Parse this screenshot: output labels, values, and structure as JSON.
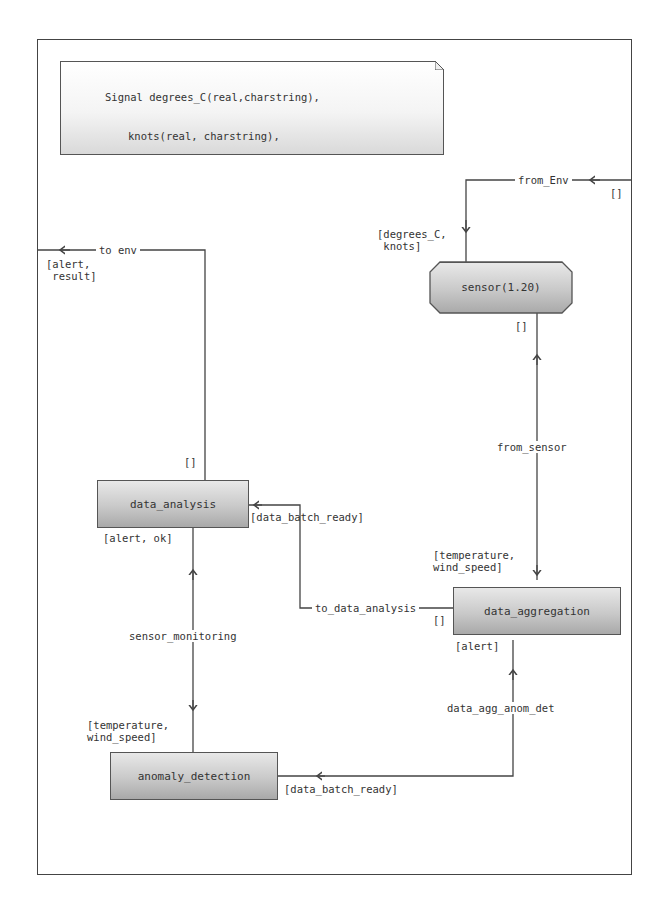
{
  "signal_note": {
    "lines": [
      "Signal degrees_C(real,charstring),",
      "knots(real, charstring),",
      "temperature(real, charstring, pid),",
      "wind_speed(real, charstring, pid),",
      "alert(integer), ok, result,",
      "data_batch_ready;"
    ]
  },
  "blocks": {
    "sensor": "sensor(1.20)",
    "data_analysis": "data_analysis",
    "data_aggregation": "data_aggregation",
    "anomaly_detection": "anomaly_detection"
  },
  "channels": {
    "from_env": "from_Env",
    "to_env": "to env",
    "from_sensor": "from_sensor",
    "to_data_analysis": "to_data_analysis",
    "sensor_monitoring": "sensor_monitoring",
    "data_agg_anom_det": "data_agg_anom_det"
  },
  "signal_lists": {
    "from_env_in": "[degrees_C,\n knots]",
    "from_env_out": "[]",
    "to_env_out": "[alert,\n result]",
    "to_env_in": "[]",
    "sensor_out": "[]",
    "aggregation_in": "[temperature,\nwind_speed]",
    "analysis_batch": "[data_batch_ready]",
    "analysis_out": "[alert, ok]",
    "to_data_analysis_src": "[]",
    "aggregation_alert": "[alert]",
    "monitoring_in": "[temperature,\nwind_speed]",
    "anomaly_batch": "[data_batch_ready]"
  },
  "colors": {
    "line": "#444444",
    "block_top": "#e8e8e8",
    "block_bottom": "#a9a9a9"
  }
}
